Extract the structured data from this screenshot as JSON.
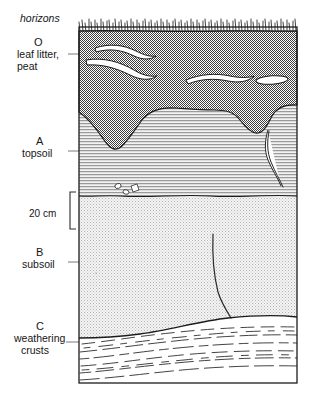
{
  "figure": {
    "title": "horizons",
    "scale_label": "20 cm",
    "frame": {
      "x": 79,
      "y": 27,
      "width": 218,
      "height": 356
    },
    "colors": {
      "ink": "#161616",
      "o_horizon_fill": "#8d8d8d",
      "a_horizon_fill": "#cfcfcf",
      "b_horizon_fill": "#e4e4e4",
      "c_horizon_fill": "#ffffff",
      "inclusion_fill": "#ffffff",
      "leader_line": "#555555",
      "background": "#ffffff"
    },
    "horizons": [
      {
        "code": "O",
        "name_lines": [
          "leaf litter,",
          "peat"
        ],
        "description": "leaf litter, peat",
        "label_x": 44,
        "code_y": 44,
        "name_y": 56,
        "leader_y": 54,
        "leader_x_start": 70,
        "leader_x_end": 84,
        "top_y": 27,
        "bottom_y": 112,
        "surface_feature": "grass-tufts",
        "inclusions": [
          "white root streak upper-left",
          "white root streak mid-left",
          "white lens center-right",
          "white blob far-right"
        ]
      },
      {
        "code": "A",
        "name_lines": [
          "topsoil"
        ],
        "description": "topsoil",
        "label_x": 44,
        "code_y": 142,
        "name_y": 154,
        "leader_y": 148,
        "leader_x_start": 70,
        "leader_x_end": 100,
        "top_y": 90,
        "bottom_y": 196,
        "texture": "horizontal-hatch",
        "inclusions": [
          "white angular pebbles near lower boundary",
          "dark root trace at right"
        ]
      },
      {
        "code": "B",
        "name_lines": [
          "subsoil"
        ],
        "description": "subsoil",
        "label_x": 44,
        "code_y": 253,
        "name_y": 265,
        "leader_y": 258,
        "leader_x_start": 70,
        "leader_x_end": 92,
        "top_y": 196,
        "bottom_y": 318,
        "texture": "fine-stipple",
        "inclusions": [
          "vertical crack descending to C boundary"
        ]
      },
      {
        "code": "C",
        "name_lines": [
          "weathering",
          "crusts"
        ],
        "description": "weathering crusts",
        "label_x": 44,
        "code_y": 326,
        "name_y": 338,
        "name_y2": 350,
        "leader_y": 338,
        "leader_x_start": 68,
        "leader_x_end": 88,
        "top_y": 318,
        "bottom_y": 383,
        "texture": "wavy-dashed-layers"
      }
    ],
    "scale_bar": {
      "label": "20 cm",
      "label_x": 54,
      "label_y": 214,
      "bracket_x": 70,
      "bracket_top": 192,
      "bracket_bottom": 229,
      "tick_length": 6
    }
  }
}
